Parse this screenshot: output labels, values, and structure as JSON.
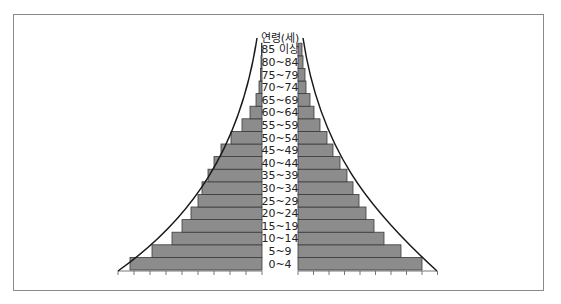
{
  "chart_data": {
    "type": "bar",
    "subtype": "population-pyramid",
    "title": "",
    "ylabel": "연령(세)",
    "xlabel": "",
    "categories": [
      "0~4",
      "5~9",
      "10~14",
      "15~19",
      "20~24",
      "25~29",
      "30~34",
      "35~39",
      "40~44",
      "45~49",
      "50~54",
      "55~59",
      "60~64",
      "65~69",
      "70~74",
      "75~79",
      "80~84",
      "85 이상"
    ],
    "series": [
      {
        "name": "left",
        "side": "left",
        "values": [
          132,
          110,
          90,
          80,
          71,
          64,
          60,
          54,
          48,
          41,
          31,
          20,
          12,
          6,
          3,
          1.5,
          1,
          0.5
        ]
      },
      {
        "name": "right",
        "side": "right",
        "values": [
          124,
          103,
          86,
          76,
          68,
          61,
          55,
          49,
          42,
          35,
          29,
          22,
          16,
          12,
          8,
          7,
          5,
          4
        ]
      }
    ],
    "axis": {
      "left_ticks": 9,
      "right_ticks": 9,
      "grid": false
    },
    "overlay_curves": "concave curve envelopes on each side",
    "legend": "none"
  },
  "labels": {
    "axis_title": "연령(세)",
    "rows": [
      "85 이상",
      "80~84",
      "75~79",
      "70~74",
      "65~69",
      "60~64",
      "55~59",
      "50~54",
      "45~49",
      "40~44",
      "35~39",
      "30~34",
      "25~29",
      "20~24",
      "15~19",
      "10~14",
      "5~9",
      "0~4"
    ]
  },
  "colors": {
    "bar_fill": "#8c8c8c",
    "bar_stroke": "#3a3a3a",
    "curve": "#1a1a1a",
    "frame": "#8a8a8a"
  }
}
